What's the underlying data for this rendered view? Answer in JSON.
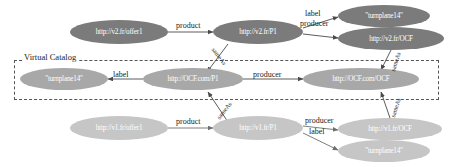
{
  "diagram": {
    "group_box_label": "Virtual Catalog",
    "colors": {
      "node_dark": "#7b7b7b",
      "node_mid": "#a8a8a8",
      "node_light": "#c6c6c6",
      "edge": "#4a4a4a",
      "text": "#1a1a1a",
      "node_text": "#ffffff",
      "box_border": "#555555",
      "background": "#ffffff"
    },
    "nodes": [
      {
        "id": "v2_offer1",
        "label": "http://v2.fr/offer1",
        "tone": "dark",
        "row": "top"
      },
      {
        "id": "v2_p1",
        "label": "http://v2.fr/P1",
        "tone": "dark",
        "row": "top"
      },
      {
        "id": "v2_turn",
        "label": "\"turnplane14\"",
        "tone": "dark",
        "row": "top"
      },
      {
        "id": "v2_ocf",
        "label": "http://v2.fr/OCF",
        "tone": "dark",
        "row": "top"
      },
      {
        "id": "vc_turn",
        "label": "\"turnplane14\"",
        "tone": "mid",
        "row": "virtual-catalog"
      },
      {
        "id": "vc_p1",
        "label": "http://OCF.com/P1",
        "tone": "mid",
        "row": "virtual-catalog"
      },
      {
        "id": "vc_ocf",
        "label": "http://OCF.com/OCF",
        "tone": "mid",
        "row": "virtual-catalog"
      },
      {
        "id": "v1_offer1",
        "label": "http://v1.fr/offer1",
        "tone": "light",
        "row": "bottom"
      },
      {
        "id": "v1_p1",
        "label": "http://v1.fr/P1",
        "tone": "light",
        "row": "bottom"
      },
      {
        "id": "v1_ocf",
        "label": "http://v1.fr/OCF",
        "tone": "light",
        "row": "bottom"
      },
      {
        "id": "v1_turn",
        "label": "\"turnplane14\"",
        "tone": "light",
        "row": "bottom"
      }
    ],
    "edges": [
      {
        "id": "e1",
        "from": "v2_offer1",
        "to": "v2_p1",
        "label": "product"
      },
      {
        "id": "e2",
        "from": "v2_p1",
        "to": "v2_turn",
        "label": "label"
      },
      {
        "id": "e3",
        "from": "v2_p1",
        "to": "v2_ocf",
        "label": "producer"
      },
      {
        "id": "e4",
        "from": "v2_p1",
        "to": "vc_p1",
        "label": "sameAs"
      },
      {
        "id": "e5",
        "from": "v2_ocf",
        "to": "vc_ocf",
        "label": "sameAs"
      },
      {
        "id": "e6",
        "from": "vc_p1",
        "to": "vc_turn",
        "label": "label"
      },
      {
        "id": "e7",
        "from": "vc_p1",
        "to": "vc_ocf",
        "label": "producer"
      },
      {
        "id": "e8",
        "from": "v1_p1",
        "to": "vc_p1",
        "label": "sameAs"
      },
      {
        "id": "e9",
        "from": "v1_ocf",
        "to": "vc_ocf",
        "label": "sameAs"
      },
      {
        "id": "e10",
        "from": "v1_offer1",
        "to": "v1_p1",
        "label": "product"
      },
      {
        "id": "e11",
        "from": "v1_p1",
        "to": "v1_ocf",
        "label": "producer"
      },
      {
        "id": "e12",
        "from": "v1_p1",
        "to": "v1_turn",
        "label": "label"
      }
    ]
  }
}
